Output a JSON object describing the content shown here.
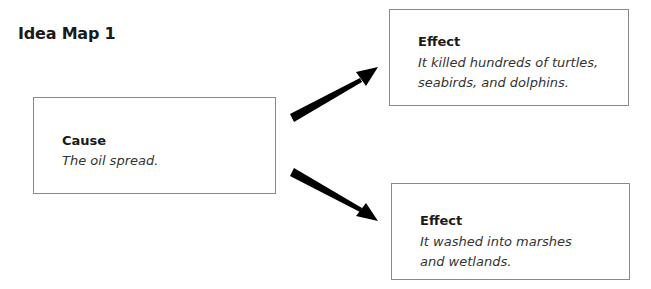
{
  "title": "Idea Map 1",
  "cause": {
    "label": "Cause",
    "text": "The oil spread."
  },
  "effects": [
    {
      "label": "Effect",
      "text": "It killed hundreds of turtles, seabirds, and dolphins."
    },
    {
      "label": "Effect",
      "text": "It washed into marshes and wetlands."
    }
  ],
  "colors": {
    "arrow": "#000000",
    "border": "#8a8a8a"
  }
}
